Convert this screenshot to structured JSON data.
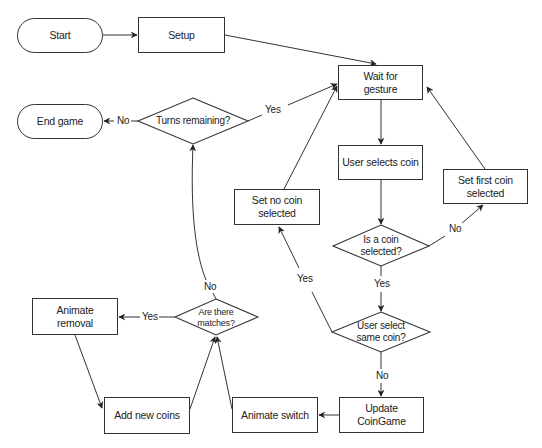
{
  "diagram": {
    "type": "flowchart",
    "colors": {
      "stroke": "#333333",
      "text": "#222222",
      "background": "#ffffff"
    },
    "nodes": {
      "start": {
        "label": "Start",
        "shape": "terminal"
      },
      "setup": {
        "label": "Setup",
        "shape": "process"
      },
      "wait": {
        "label": "Wait for gesture",
        "shape": "process"
      },
      "user_selects": {
        "label": "User selects coin",
        "shape": "process"
      },
      "set_first": {
        "label": "Set first coin selected",
        "shape": "process"
      },
      "set_no": {
        "label": "Set no coin selected",
        "shape": "process"
      },
      "is_selected": {
        "label": "Is a coin selected?",
        "shape": "decision"
      },
      "same_coin": {
        "label": "User select same coin?",
        "shape": "decision"
      },
      "update": {
        "label": "Update CoinGame",
        "shape": "process"
      },
      "animate_switch": {
        "label": "Animate switch",
        "shape": "process"
      },
      "add_coins": {
        "label": "Add new coins",
        "shape": "process"
      },
      "animate_removal": {
        "label": "Animate removal",
        "shape": "process"
      },
      "matches": {
        "label": "Are there matches?",
        "shape": "decision"
      },
      "turns": {
        "label": "Turns remaining?",
        "shape": "decision"
      },
      "end": {
        "label": "End game",
        "shape": "terminal"
      }
    },
    "edges": [
      {
        "from": "start",
        "to": "setup",
        "label": ""
      },
      {
        "from": "setup",
        "to": "wait",
        "label": ""
      },
      {
        "from": "wait",
        "to": "user_selects",
        "label": ""
      },
      {
        "from": "user_selects",
        "to": "is_selected",
        "label": ""
      },
      {
        "from": "is_selected",
        "to": "set_first",
        "label": "No"
      },
      {
        "from": "set_first",
        "to": "wait",
        "label": ""
      },
      {
        "from": "is_selected",
        "to": "same_coin",
        "label": "Yes"
      },
      {
        "from": "same_coin",
        "to": "set_no",
        "label": "Yes"
      },
      {
        "from": "set_no",
        "to": "wait",
        "label": ""
      },
      {
        "from": "same_coin",
        "to": "update",
        "label": "No"
      },
      {
        "from": "update",
        "to": "animate_switch",
        "label": ""
      },
      {
        "from": "animate_switch",
        "to": "matches",
        "label": ""
      },
      {
        "from": "matches",
        "to": "animate_removal",
        "label": "Yes"
      },
      {
        "from": "animate_removal",
        "to": "add_coins",
        "label": ""
      },
      {
        "from": "add_coins",
        "to": "matches",
        "label": ""
      },
      {
        "from": "matches",
        "to": "turns",
        "label": "No"
      },
      {
        "from": "turns",
        "to": "wait",
        "label": "Yes"
      },
      {
        "from": "turns",
        "to": "end",
        "label": "No"
      }
    ],
    "edge_labels": {
      "is_selected_no": "No",
      "is_selected_yes": "Yes",
      "same_coin_yes": "Yes",
      "same_coin_no": "No",
      "matches_yes": "Yes",
      "matches_no": "No",
      "turns_yes": "Yes",
      "turns_no": "No"
    }
  }
}
